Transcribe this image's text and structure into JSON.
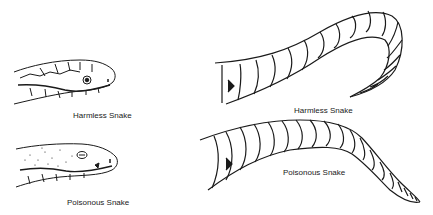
{
  "figures": {
    "harmless_head": {
      "label": "Harmless Snake"
    },
    "poisonous_head": {
      "label": "Poisonous Snake"
    },
    "harmless_tail": {
      "label": "Harmless Snake"
    },
    "poisonous_tail": {
      "label": "Poisonous Snake"
    }
  },
  "colors": {
    "ink": "#1a1a1a",
    "background": "#ffffff"
  }
}
